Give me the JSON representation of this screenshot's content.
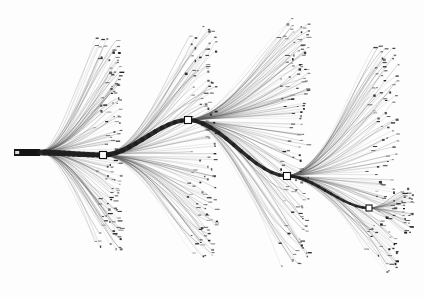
{
  "figure": {
    "title": "Hierarchical edge-bundled dendrogram",
    "type": "tree-diagram",
    "background_color": "#fdfdfd",
    "edge_color": "#5a5a5a",
    "trunk_color": "#1e1e1e",
    "node_fill": "#ffffff",
    "node_stroke": "#111111",
    "leaf_color": "#1a1a1a",
    "width": 424,
    "height": 297
  },
  "root": {
    "name": "root-bar",
    "x": 14,
    "y": 149,
    "width": 26,
    "height": 7
  },
  "nodes": [
    {
      "id": "n1",
      "label": "",
      "x": 103,
      "y": 155,
      "size": 7
    },
    {
      "id": "n2",
      "label": "",
      "x": 188,
      "y": 120,
      "size": 7
    },
    {
      "id": "n3",
      "label": "",
      "x": 287,
      "y": 176,
      "size": 7
    },
    {
      "id": "n4",
      "label": "",
      "x": 369,
      "y": 208,
      "size": 6
    }
  ],
  "backbone": [
    {
      "from": "root",
      "to": "n1"
    },
    {
      "from": "n1",
      "to": "n2"
    },
    {
      "from": "n2",
      "to": "n3"
    },
    {
      "from": "n3",
      "to": "n4"
    }
  ],
  "clusters": [
    {
      "id": "c1",
      "origin_node": "n1",
      "origin": [
        40,
        152
      ],
      "upper_edges": 62,
      "lower_edges": 58,
      "leaf_column_x": [
        88,
        96,
        104,
        112,
        120
      ],
      "leaf_top_y": 36,
      "leaf_bottom_y": 250
    },
    {
      "id": "c2",
      "origin_node": "n2",
      "origin": [
        103,
        155
      ],
      "upper_edges": 58,
      "lower_edges": 54,
      "leaf_column_x": [
        178,
        186,
        196,
        206,
        216
      ],
      "leaf_top_y": 26,
      "leaf_bottom_y": 258
    },
    {
      "id": "c3",
      "origin_node": "n3",
      "origin": [
        188,
        120
      ],
      "upper_edges": 64,
      "lower_edges": 60,
      "leaf_column_x": [
        272,
        281,
        290,
        299,
        308
      ],
      "leaf_top_y": 20,
      "leaf_bottom_y": 268
    },
    {
      "id": "c4",
      "origin_node": "n4",
      "origin": [
        287,
        176
      ],
      "upper_edges": 56,
      "lower_edges": 52,
      "leaf_column_x": [
        358,
        368,
        378,
        388,
        398
      ],
      "leaf_top_y": 44,
      "leaf_bottom_y": 272
    },
    {
      "id": "c5",
      "origin_node": "terminal",
      "origin": [
        369,
        208
      ],
      "upper_edges": 16,
      "lower_edges": 14,
      "leaf_column_x": [
        398,
        406,
        412
      ],
      "leaf_top_y": 190,
      "leaf_bottom_y": 232
    }
  ],
  "legend": {
    "internal_node_label": "",
    "leaf_label": "",
    "visible_text": "none"
  },
  "annotations": []
}
